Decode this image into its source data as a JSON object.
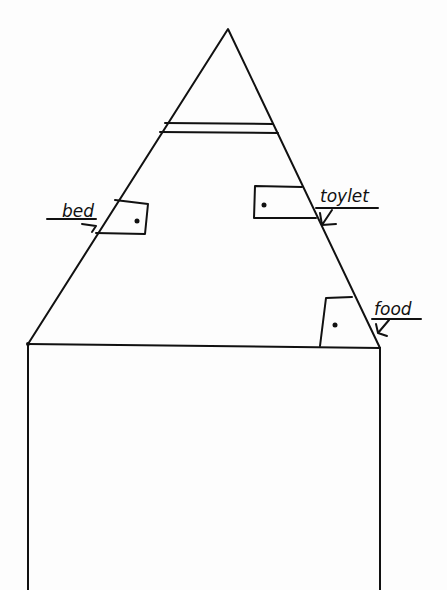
{
  "diagram": {
    "type": "hand-drawn sketch",
    "colors": {
      "ink": "#111111",
      "paper": "#fdfdfd"
    },
    "labels": {
      "bed": "bed",
      "toilet": "toylet",
      "food": "food"
    }
  }
}
